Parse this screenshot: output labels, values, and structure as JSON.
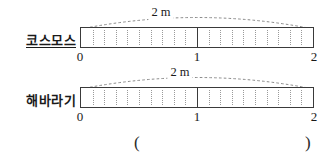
{
  "page": {
    "background_color": "#ffffff",
    "line_color": "#3a3a3a",
    "tick_color": "#9a9a9a",
    "text_color": "#1a1a1a"
  },
  "rows": [
    {
      "label": "코스모스",
      "underlined": true,
      "span_caption": "2 m",
      "axis_ticks": [
        "0",
        "1",
        "2"
      ],
      "total_length_m": 2,
      "subdivisions_per_meter": 10
    },
    {
      "label": "해바라기",
      "underlined": false,
      "span_caption": "2 m",
      "axis_ticks": [
        "0",
        "1",
        "2"
      ],
      "total_length_m": 2,
      "subdivisions_per_meter": 10
    }
  ],
  "answer_blank": {
    "open_paren": "(",
    "close_paren": ")",
    "value": ""
  }
}
